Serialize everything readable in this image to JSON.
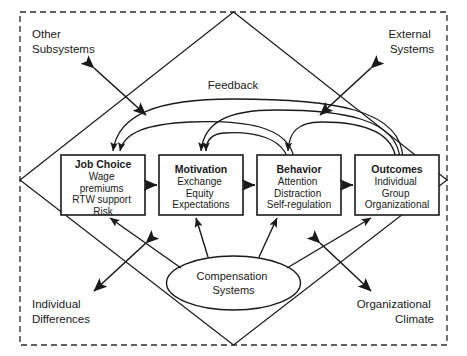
{
  "diagram": {
    "type": "flow-diagram",
    "colors": {
      "stroke": "#1a1a1a",
      "background": "#ffffff",
      "text": "#1a1a1a"
    },
    "outer_boundary": {
      "shape": "dashed-rectangle",
      "name": "context-boundary"
    },
    "diamond": {
      "shape": "diamond",
      "name": "environment-diamond"
    },
    "corner_labels": [
      {
        "id": "other-subsystems",
        "lines": [
          "Other",
          "Subsystems"
        ],
        "position": "top-left"
      },
      {
        "id": "external-systems",
        "lines": [
          "External",
          "Systems"
        ],
        "position": "top-right"
      },
      {
        "id": "individual-differences",
        "lines": [
          "Individual",
          "Differences"
        ],
        "position": "bottom-left"
      },
      {
        "id": "organizational-climate",
        "lines": [
          "Organizational",
          "Climate"
        ],
        "position": "bottom-right"
      }
    ],
    "feedback_label": "Feedback",
    "boxes": [
      {
        "id": "job-choice",
        "title": "Job Choice",
        "items": [
          "Wage",
          "premiums",
          "RTW support",
          "Risk"
        ]
      },
      {
        "id": "motivation",
        "title": "Motivation",
        "items": [
          "Exchange",
          "Equity",
          "Expectations"
        ]
      },
      {
        "id": "behavior",
        "title": "Behavior",
        "items": [
          "Attention",
          "Distraction",
          "Self-regulation"
        ]
      },
      {
        "id": "outcomes",
        "title": "Outcomes",
        "items": [
          "Individual",
          "Group",
          "Organizational"
        ]
      }
    ],
    "ellipse": {
      "id": "compensation-systems",
      "lines": [
        "Compensation",
        "Systems"
      ]
    },
    "flow_arrows": [
      {
        "from": "job-choice",
        "to": "motivation"
      },
      {
        "from": "motivation",
        "to": "behavior"
      },
      {
        "from": "behavior",
        "to": "outcomes"
      }
    ],
    "feedback_arcs": [
      {
        "from": "outcomes",
        "to": "job-choice"
      },
      {
        "from": "outcomes",
        "to": "motivation"
      },
      {
        "from": "behavior",
        "to": "job-choice"
      },
      {
        "from": "behavior",
        "to": "motivation"
      },
      {
        "from": "outcomes",
        "to": "behavior"
      }
    ],
    "ellipse_arrows": [
      {
        "from": "compensation-systems",
        "to": "job-choice"
      },
      {
        "from": "compensation-systems",
        "to": "motivation"
      },
      {
        "from": "compensation-systems",
        "to": "behavior"
      },
      {
        "from": "compensation-systems",
        "to": "outcomes"
      }
    ],
    "context_arrows": [
      {
        "id": "other-subsystems-arrow",
        "direction": "bidirectional"
      },
      {
        "id": "external-systems-arrow",
        "direction": "bidirectional"
      },
      {
        "id": "individual-differences-arrow",
        "direction": "bidirectional"
      },
      {
        "id": "organizational-climate-arrow",
        "direction": "bidirectional"
      }
    ]
  }
}
